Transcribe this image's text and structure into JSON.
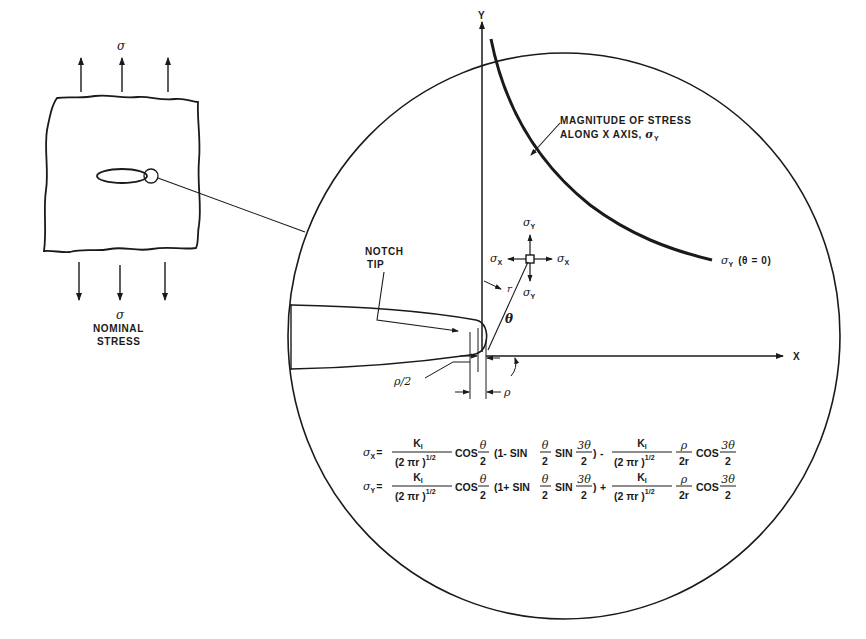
{
  "left_panel": {
    "top_stress_symbol": "σ",
    "bottom_stress_symbol": "σ",
    "bottom_label_line1": "NOMINAL",
    "bottom_label_line2": "STRESS"
  },
  "magnified_view": {
    "axis_y_label": "Y",
    "axis_x_label": "X",
    "curve_label_line1": "MAGNITUDE OF STRESS",
    "curve_label_line2": "ALONG X AXIS, ",
    "curve_label_symbol": "σ",
    "curve_label_subscript": "Y",
    "curve_end_symbol": "σ",
    "curve_end_subscript": "Y",
    "curve_end_condition": "(θ = 0)",
    "notch_label_line1": "NOTCH",
    "notch_label_line2": "TIP",
    "element": {
      "sigma_symbol": "σ",
      "top_sub": "Y",
      "bottom_sub": "Y",
      "left_sub": "X",
      "right_sub": "X"
    },
    "r_label": "r",
    "theta_label": "θ",
    "rho_half_label": "ρ/2",
    "rho_label": "ρ"
  },
  "equations": {
    "eq1": {
      "lhs_symbol": "σ",
      "lhs_sub": "X",
      "equals": "=",
      "k_num": "K",
      "k_sub": "I",
      "den": "(2 πr )",
      "den_exp": "1/2",
      "cos": "COS",
      "theta": "θ",
      "two": "2",
      "paren_open": "(1- SIN",
      "sin": "SIN",
      "three_theta": "3θ",
      "paren_close": ")",
      "op": "-",
      "rho": "ρ",
      "two_r": "2r"
    },
    "eq2": {
      "lhs_symbol": "σ",
      "lhs_sub": "Y",
      "equals": "=",
      "k_num": "K",
      "k_sub": "I",
      "den": "(2 πr )",
      "den_exp": "1/2",
      "cos": "COS",
      "theta": "θ",
      "two": "2",
      "paren_open": "(1+ SIN",
      "sin": "SIN",
      "three_theta": "3θ",
      "paren_close": ")",
      "op": "+",
      "rho": "ρ",
      "two_r": "2r"
    }
  },
  "colors": {
    "ink": "#1a1a1a",
    "background": "#ffffff"
  }
}
